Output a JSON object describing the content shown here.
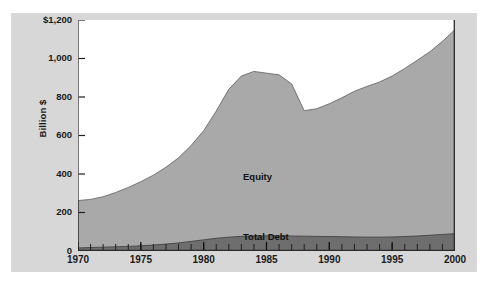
{
  "chart_data": {
    "type": "area",
    "stacked": true,
    "title": "",
    "subtitle": "",
    "xlabel": "",
    "ylabel": "Billion $",
    "xlim": [
      1970,
      2000
    ],
    "ylim": [
      0,
      1200
    ],
    "grid": false,
    "legend_position": "inline-annotation",
    "y_ticks": [
      "$1,200",
      "1,000",
      "800",
      "600",
      "400",
      "200",
      "0"
    ],
    "y_tick_values": [
      1200,
      1000,
      800,
      600,
      400,
      200,
      0
    ],
    "x_ticks": [
      "1970",
      "1975",
      "1980",
      "1985",
      "1990",
      "1995",
      "2000"
    ],
    "x_tick_values": [
      1970,
      1975,
      1980,
      1985,
      1990,
      1995,
      2000
    ],
    "x_minor_tick_interval": 1,
    "annotations": [
      {
        "text": "Equity",
        "x": 1985,
        "y": 420
      },
      {
        "text": "Total Debt",
        "x": 1985,
        "y": 95
      }
    ],
    "x": [
      1970,
      1971,
      1972,
      1973,
      1974,
      1975,
      1976,
      1977,
      1978,
      1979,
      1980,
      1981,
      1982,
      1983,
      1984,
      1985,
      1986,
      1987,
      1988,
      1989,
      1990,
      1991,
      1992,
      1993,
      1994,
      1995,
      1996,
      1997,
      1998,
      1999,
      2000
    ],
    "series": [
      {
        "name": "Total Debt",
        "color": "#6e6e6e",
        "values": [
          16,
          18,
          20,
          22,
          24,
          27,
          31,
          36,
          42,
          50,
          58,
          66,
          72,
          76,
          78,
          79,
          79,
          78,
          77,
          76,
          75,
          74,
          73,
          72,
          72,
          73,
          75,
          78,
          82,
          86,
          90
        ]
      },
      {
        "name": "Equity",
        "color": "#a9a9a9",
        "values": [
          246,
          250,
          262,
          282,
          306,
          333,
          363,
          399,
          442,
          498,
          567,
          661,
          768,
          833,
          855,
          845,
          836,
          790,
          652,
          663,
          690,
          722,
          757,
          783,
          806,
          836,
          873,
          913,
          953,
          1003,
          1060
        ]
      }
    ],
    "totals": [
      262,
      268,
      282,
      304,
      330,
      360,
      394,
      435,
      484,
      548,
      625,
      727,
      840,
      909,
      933,
      924,
      915,
      868,
      729,
      739,
      765,
      796,
      830,
      855,
      878,
      909,
      948,
      991,
      1035,
      1089,
      1150
    ],
    "colors": {
      "equity_fill": "#a9a9a9",
      "debt_fill": "#6e6e6e",
      "panel_background": "#d7d7d7",
      "plot_background": "#ffffff",
      "axis_line": "#2b2b2b",
      "text": "#1a1a1a"
    }
  },
  "axis": {
    "y_title": "Billion $"
  },
  "labels": {
    "equity": "Equity",
    "total_debt": "Total Debt"
  }
}
